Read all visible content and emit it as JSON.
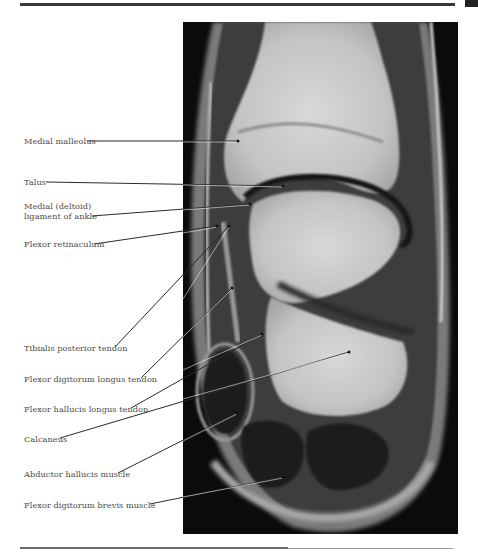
{
  "page": {
    "type": "anatomy-atlas-page",
    "figure": "Coronal MRI of ankle and hindfoot"
  },
  "labels": [
    {
      "id": "medial-malleolus",
      "text": "Medial malleolus"
    },
    {
      "id": "talus",
      "text": "Talus"
    },
    {
      "id": "medial-deltoid-ligament",
      "line1": "Medial (deltoid)",
      "line2": "ligament of ankle"
    },
    {
      "id": "flexor-retinaculum",
      "text": "Flexor retinaculum"
    },
    {
      "id": "tibialis-posterior-tendon",
      "text": "Tibialis posterior tendon"
    },
    {
      "id": "flexor-digitorum-longus-tendon",
      "text": "Flexor digitorum longus tendon"
    },
    {
      "id": "flexor-hallucis-longus-tendon",
      "text": "Flexor hallucis longus tendon"
    },
    {
      "id": "calcaneus",
      "text": "Calcaneus"
    },
    {
      "id": "abductor-hallucis-muscle",
      "text": "Abductor hallucis muscle"
    },
    {
      "id": "flexor-digitorum-brevis-muscle",
      "text": "Flexor digitorum brevis muscle"
    }
  ],
  "colors": {
    "label_text": "#4a4a4a",
    "rule": "#3a3a3a",
    "image_bg": "#0b0b0b"
  }
}
